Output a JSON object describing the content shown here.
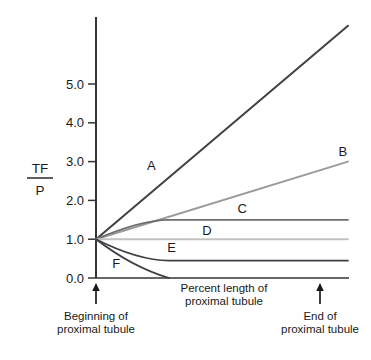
{
  "chart_data": {
    "type": "line",
    "title": "",
    "subtitle": "",
    "xlabel": "Percent length of proximal tubule",
    "ylabel": "TF/P",
    "ylabel_numerator": "TF",
    "ylabel_denominator": "P",
    "xlim": [
      0,
      100
    ],
    "ylim": [
      0,
      6.5
    ],
    "grid": false,
    "legend": "inline-labels",
    "x_tick_labels": [],
    "y_tick_labels": [
      "0.0",
      "1.0",
      "2.0",
      "3.0",
      "4.0",
      "5.0"
    ],
    "y_tick_values": [
      0.0,
      1.0,
      2.0,
      3.0,
      4.0,
      5.0
    ],
    "x_annotations": [
      {
        "label_line1": "Beginning of",
        "label_line2": "proximal tubule",
        "x": 0,
        "arrow": "up"
      },
      {
        "label_line1": "End of",
        "label_line2": "proximal tubule",
        "x": 89,
        "arrow": "up"
      }
    ],
    "series": [
      {
        "name": "A",
        "label": "A",
        "color": "#3f3f46",
        "width": 2.0,
        "x": [
          0,
          100
        ],
        "values": [
          1.0,
          6.5
        ],
        "shape": "linear-rising",
        "label_x": 22,
        "label_y": 2.9
      },
      {
        "name": "B",
        "label": "B",
        "color": "#9a9a9a",
        "width": 2.0,
        "x": [
          0,
          100
        ],
        "values": [
          1.0,
          3.0
        ],
        "shape": "linear-rising",
        "label_x": 98,
        "label_y": 3.25
      },
      {
        "name": "C",
        "label": "C",
        "color": "#6e6e6e",
        "width": 1.8,
        "x": [
          0,
          29,
          100
        ],
        "values": [
          1.0,
          1.5,
          1.5
        ],
        "shape": "rise-then-plateau",
        "label_x": 58,
        "label_y": 1.78
      },
      {
        "name": "D",
        "label": "D",
        "color": "#c2c2c2",
        "width": 2.0,
        "x": [
          0,
          100
        ],
        "values": [
          1.0,
          1.0
        ],
        "shape": "flat",
        "label_x": 44,
        "label_y": 1.22
      },
      {
        "name": "E",
        "label": "E",
        "color": "#3f3f46",
        "width": 1.8,
        "x": [
          0,
          29,
          100
        ],
        "values": [
          1.0,
          0.45,
          0.45
        ],
        "shape": "fall-then-plateau",
        "label_x": 30,
        "label_y": 0.78
      },
      {
        "name": "F",
        "label": "F",
        "color": "#3f3f46",
        "width": 1.8,
        "x": [
          0,
          29,
          100
        ],
        "values": [
          1.0,
          0.0,
          0.0
        ],
        "shape": "fall-to-zero",
        "label_x": 8,
        "label_y": 0.38
      }
    ]
  },
  "axes": {
    "y_ticks": [
      {
        "label": "0.0"
      },
      {
        "label": "1.0"
      },
      {
        "label": "2.0"
      },
      {
        "label": "3.0"
      },
      {
        "label": "4.0"
      },
      {
        "label": "5.0"
      }
    ],
    "y_axis_title_numerator": "TF",
    "y_axis_title_denominator": "P",
    "x_axis_title_line1": "Percent length of",
    "x_axis_title_line2": "proximal tubule"
  },
  "annotations": {
    "begin_line1": "Beginning of",
    "begin_line2": "proximal tubule",
    "end_line1": "End of",
    "end_line2": "proximal tubule"
  },
  "curve_labels": {
    "a": "A",
    "b": "B",
    "c": "C",
    "d": "D",
    "e": "E",
    "f": "F"
  },
  "colors": {
    "axis": "#333333",
    "text": "#1a1a1a",
    "background": "#ffffff",
    "curve_a": "#3f3f46",
    "curve_b": "#9a9a9a",
    "curve_c": "#6e6e6e",
    "curve_d": "#c2c2c2",
    "curve_e": "#3f3f46",
    "curve_f": "#3f3f46"
  }
}
